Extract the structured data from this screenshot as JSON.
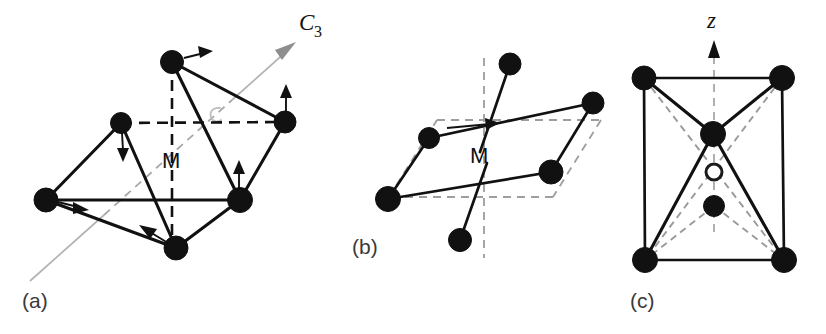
{
  "figure": {
    "background_color": "#ffffff",
    "atom_color": "#111111",
    "bond_color": "#111111",
    "dashed_guide_color": "#9a9a9a",
    "axis_color": "#b3b3b3",
    "width": 826,
    "height": 334
  },
  "panels": [
    {
      "id": "a",
      "label": "(a)",
      "label_pos": {
        "x": 22,
        "y": 308
      },
      "center_label": "M",
      "center_label_pos": {
        "x": 162,
        "y": 168
      },
      "axis_label": "C",
      "axis_label_sub": "3",
      "axis_label_pos": {
        "x": 299,
        "y": 30
      },
      "description": "Octahedral MX6 unit with C3 rotation axis and trigonal distortion displacement arrows",
      "atoms": [
        {
          "name": "top",
          "x": 172,
          "y": 62,
          "r": 11.5
        },
        {
          "name": "upper-left",
          "x": 121,
          "y": 123,
          "r": 10.5
        },
        {
          "name": "upper-right",
          "x": 285,
          "y": 122,
          "r": 11
        },
        {
          "name": "left",
          "x": 46,
          "y": 200,
          "r": 12
        },
        {
          "name": "right",
          "x": 240,
          "y": 200,
          "r": 12.5
        },
        {
          "name": "bottom",
          "x": 176,
          "y": 248,
          "r": 12
        }
      ],
      "solid_bonds": [
        [
          172,
          62,
          285,
          122
        ],
        [
          172,
          62,
          240,
          200
        ],
        [
          172,
          62,
          176,
          248
        ],
        [
          121,
          123,
          46,
          200
        ],
        [
          121,
          123,
          176,
          248
        ],
        [
          285,
          122,
          240,
          200
        ],
        [
          46,
          200,
          240,
          200
        ],
        [
          46,
          200,
          176,
          248
        ],
        [
          240,
          200,
          176,
          248
        ]
      ],
      "dashed_bonds": [
        [
          121,
          123,
          285,
          122
        ],
        [
          172,
          62,
          172,
          248
        ]
      ],
      "rotation_axis": {
        "from": {
          "x": 30,
          "y": 281
        },
        "to": {
          "x": 296,
          "y": 42
        },
        "dashed_segment_from": {
          "x": 104,
          "y": 215
        },
        "dashed_segment_to": {
          "x": 232,
          "y": 100
        }
      },
      "displacement_arrows": [
        {
          "atom": "top",
          "dx": 34,
          "dy": -11
        },
        {
          "atom": "upper-left",
          "dx": 2,
          "dy": 33
        },
        {
          "atom": "upper-right",
          "dx": 2,
          "dy": -34
        },
        {
          "atom": "right",
          "dx": -1,
          "dy": -36
        },
        {
          "atom": "left",
          "dx": 38,
          "dy": 11
        },
        {
          "atom": "bottom",
          "dx": -37,
          "dy": -22
        }
      ]
    },
    {
      "id": "b",
      "label": "(b)",
      "label_pos": {
        "x": 352,
        "y": 254
      },
      "center_label": "M",
      "center_label_pos": {
        "x": 470,
        "y": 163
      },
      "description": "Flattened trigonal antiprism view showing the equatorial plane and axial ligands",
      "atoms": [
        {
          "name": "axial-top",
          "x": 510,
          "y": 64,
          "r": 11
        },
        {
          "name": "plane-upper-left",
          "x": 429,
          "y": 138,
          "r": 10.5
        },
        {
          "name": "plane-upper-right",
          "x": 593,
          "y": 103,
          "r": 11
        },
        {
          "name": "plane-lower-right",
          "x": 551,
          "y": 172,
          "r": 12
        },
        {
          "name": "plane-lower-left",
          "x": 388,
          "y": 199,
          "r": 12.5
        },
        {
          "name": "axial-bottom",
          "x": 460,
          "y": 240,
          "r": 11.5
        }
      ],
      "solid_bonds": [
        [
          429,
          138,
          593,
          103
        ],
        [
          429,
          138,
          388,
          199
        ],
        [
          593,
          103,
          551,
          172
        ],
        [
          388,
          199,
          551,
          172
        ],
        [
          510,
          64,
          480,
          152
        ],
        [
          460,
          240,
          487,
          163
        ]
      ],
      "plane_outline": [
        [
          437,
          120,
          601,
          120
        ],
        [
          601,
          120,
          553,
          197
        ],
        [
          553,
          197,
          389,
          197
        ],
        [
          389,
          197,
          437,
          120
        ]
      ],
      "vertical_axis": {
        "x": 484,
        "y_top": 58,
        "y_bottom": 258
      },
      "in_plane_arrow": {
        "x1": 447,
        "y1": 129,
        "x2": 500,
        "y2": 123
      }
    },
    {
      "id": "c",
      "label": "(c)",
      "label_pos": {
        "x": 630,
        "y": 308
      },
      "axis_label": "z",
      "axis_label_pos": {
        "x": 710,
        "y": 27
      },
      "description": "Bicapped / tetragonal unit cell view with z axis, filled atoms and one open circle site",
      "atoms": [
        {
          "name": "corner-top-left",
          "x": 644,
          "y": 78,
          "r": 12
        },
        {
          "name": "corner-top-right",
          "x": 782,
          "y": 78,
          "r": 12.5
        },
        {
          "name": "center-upper",
          "x": 713,
          "y": 134,
          "r": 12.5
        },
        {
          "name": "center-lower",
          "x": 714,
          "y": 206,
          "r": 10.5
        },
        {
          "name": "corner-bottom-left",
          "x": 645,
          "y": 260,
          "r": 12.5
        },
        {
          "name": "corner-bottom-right",
          "x": 784,
          "y": 260,
          "r": 12.5
        }
      ],
      "open_atoms": [
        {
          "name": "open-site",
          "x": 714,
          "y": 172,
          "r": 8
        }
      ],
      "solid_bonds": [
        [
          644,
          78,
          782,
          78
        ],
        [
          644,
          78,
          645,
          260
        ],
        [
          782,
          78,
          784,
          260
        ],
        [
          645,
          260,
          784,
          260
        ],
        [
          644,
          78,
          713,
          134
        ],
        [
          782,
          78,
          713,
          134
        ],
        [
          713,
          134,
          645,
          260
        ],
        [
          713,
          134,
          784,
          260
        ]
      ],
      "dashed_bonds": [
        [
          644,
          78,
          784,
          260
        ],
        [
          782,
          78,
          645,
          260
        ],
        [
          714,
          206,
          645,
          260
        ],
        [
          714,
          206,
          784,
          260
        ],
        [
          714,
          206,
          714,
          250
        ]
      ],
      "vertical_axis": {
        "x": 714,
        "y_top": 42,
        "y_bottom": 232
      }
    }
  ]
}
